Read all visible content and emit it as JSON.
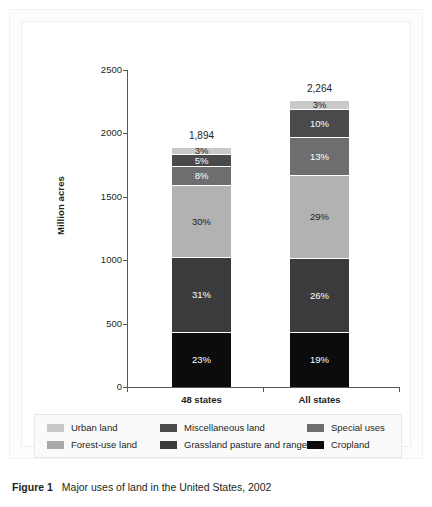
{
  "figure": {
    "caption_label": "Figure 1",
    "caption_text": "Major uses of land in the United States, 2002"
  },
  "chart_data": {
    "type": "bar",
    "subtype": "stacked-bar",
    "title": "",
    "xlabel": "",
    "ylabel": "Million acres",
    "ylim": [
      0,
      2500
    ],
    "yticks": [
      "0",
      "500",
      "1000",
      "1500",
      "2000",
      "2500"
    ],
    "ytick_values": [
      0,
      500,
      1000,
      1500,
      2000,
      2500
    ],
    "grid": false,
    "legend_position": "bottom",
    "categories": [
      "48 states",
      "All states"
    ],
    "totals": [
      "1,894",
      "2,264"
    ],
    "total_values": [
      1894,
      2264
    ],
    "series": [
      {
        "name": "Cropland",
        "color": "#0c0c0c",
        "values": [
          23,
          19
        ],
        "labels": [
          "23%",
          "19%"
        ],
        "label_color": "#ffffff"
      },
      {
        "name": "Grassland pasture and range",
        "color": "#3b3b3d",
        "values": [
          31,
          26
        ],
        "labels": [
          "31%",
          "26%"
        ],
        "label_color": "#ffffff"
      },
      {
        "name": "Forest-use land",
        "color": "#b2b2b2",
        "values": [
          30,
          29
        ],
        "labels": [
          "30%",
          "29%"
        ],
        "label_color": "#231f20"
      },
      {
        "name": "Special uses",
        "color": "#6e6e70",
        "values": [
          8,
          13
        ],
        "labels": [
          "8%",
          "13%"
        ],
        "label_color": "#ffffff"
      },
      {
        "name": "Miscellaneous land",
        "color": "#४"
      },
      {
        "name": "Urban land",
        "color": "#c9c9c9",
        "values": [
          3,
          3
        ],
        "labels": [
          "3%",
          "3%"
        ],
        "label_color": "#231f20"
      }
    ],
    "stack_order_bottom_to_top": [
      "Cropland",
      "Grassland pasture and range",
      "Forest-use land",
      "Special uses",
      "Miscellaneous land",
      "Urban land"
    ]
  },
  "bars": [
    {
      "category": "48 states",
      "total": "1,894",
      "segments": [
        {
          "name": "Urban land",
          "label": "3%",
          "pct": 3,
          "color": "#c9c9c9",
          "text_color": "#231f20"
        },
        {
          "name": "Miscellaneous land",
          "label": "5%",
          "pct": 5,
          "color": "#4a4a4c",
          "text_color": "#ffffff"
        },
        {
          "name": "Special uses",
          "label": "8%",
          "pct": 8,
          "color": "#6e6e70",
          "text_color": "#ffffff"
        },
        {
          "name": "Forest-use land",
          "label": "30%",
          "pct": 30,
          "color": "#b2b2b2",
          "text_color": "#231f20"
        },
        {
          "name": "Grassland pasture and range",
          "label": "31%",
          "pct": 31,
          "color": "#3b3b3d",
          "text_color": "#ffffff"
        },
        {
          "name": "Cropland",
          "label": "23%",
          "pct": 23,
          "color": "#0c0c0c",
          "text_color": "#ffffff"
        }
      ]
    },
    {
      "category": "All states",
      "total": "2,264",
      "segments": [
        {
          "name": "Urban land",
          "label": "3%",
          "pct": 3,
          "color": "#c9c9c9",
          "text_color": "#231f20"
        },
        {
          "name": "Miscellaneous land",
          "label": "10%",
          "pct": 10,
          "color": "#4a4a4c",
          "text_color": "#ffffff"
        },
        {
          "name": "Special uses",
          "label": "13%",
          "pct": 13,
          "color": "#6e6e70",
          "text_color": "#ffffff"
        },
        {
          "name": "Forest-use land",
          "label": "29%",
          "pct": 29,
          "color": "#b2b2b2",
          "text_color": "#231f20"
        },
        {
          "name": "Grassland pasture and range",
          "label": "26%",
          "pct": 26,
          "color": "#3b3b3d",
          "text_color": "#ffffff"
        },
        {
          "name": "Cropland",
          "label": "19%",
          "pct": 19,
          "color": "#0c0c0c",
          "text_color": "#ffffff"
        }
      ]
    }
  ],
  "axis": {
    "y_title": "Million acres",
    "y_ticks": [
      "2500",
      "2000",
      "1500",
      "1000",
      "500",
      "0"
    ],
    "x_labels": [
      "48 states",
      "All states"
    ]
  },
  "legend": {
    "items": [
      {
        "label": "Urban land",
        "color": "#c9c9c9",
        "col": 0,
        "row": 0
      },
      {
        "label": "Forest-use land",
        "color": "#a8a8a8",
        "col": 0,
        "row": 1
      },
      {
        "label": "Miscellaneous land",
        "color": "#4a4a4c",
        "col": 1,
        "row": 0
      },
      {
        "label": "Grassland pasture and range",
        "color": "#3b3b3d",
        "col": 1,
        "row": 1
      },
      {
        "label": "Special uses",
        "color": "#6e6e70",
        "col": 2,
        "row": 0
      },
      {
        "label": "Cropland",
        "color": "#0c0c0c",
        "col": 2,
        "row": 1
      }
    ]
  }
}
